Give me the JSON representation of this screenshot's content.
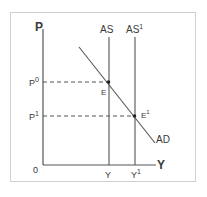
{
  "diagram": {
    "type": "AS-AD shift",
    "axes": {
      "y_label": "P",
      "x_label": "Y",
      "origin": "0"
    },
    "curves": {
      "as": {
        "label": "AS",
        "sup": ""
      },
      "as1": {
        "label": "AS",
        "sup": "1"
      },
      "ad": {
        "label": "AD"
      }
    },
    "points": {
      "e": {
        "label": "E"
      },
      "e1": {
        "label": "E",
        "sup": "1"
      }
    },
    "ticks": {
      "p0": {
        "label": "P",
        "sup": "0"
      },
      "p1": {
        "label": "P",
        "sup": "1"
      },
      "y": {
        "label": "Y",
        "sup": ""
      },
      "y1": {
        "label": "Y",
        "sup": "1"
      }
    },
    "colors": {
      "line": "#555555",
      "frame": "#cfcfcf"
    }
  }
}
